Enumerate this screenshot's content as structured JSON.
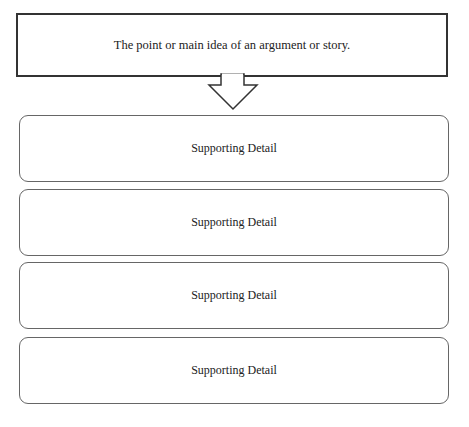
{
  "diagram": {
    "main_idea": {
      "text": "The point or main idea of an argument or story."
    },
    "arrow": {
      "direction": "down",
      "icon": "hollow-down-arrow"
    },
    "details": [
      {
        "text": "Supporting Detail"
      },
      {
        "text": "Supporting Detail"
      },
      {
        "text": "Supporting Detail"
      },
      {
        "text": "Supporting Detail"
      }
    ],
    "colors": {
      "main_border": "#333333",
      "detail_border": "#666666",
      "background": "#ffffff"
    }
  }
}
